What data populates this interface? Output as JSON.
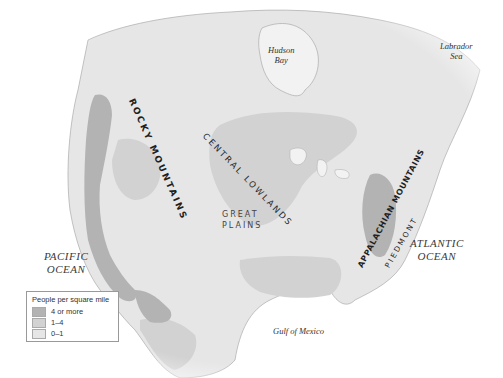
{
  "map": {
    "subject": "North America population density",
    "water_labels": {
      "hudson_bay": [
        "Hudson",
        "Bay"
      ],
      "labrador_sea": [
        "Labrador",
        "Sea"
      ],
      "pacific_ocean": [
        "PACIFIC",
        "OCEAN"
      ],
      "atlantic_ocean": [
        "ATLANTIC",
        "OCEAN"
      ],
      "gulf_of_mexico": "Gulf of Mexico"
    },
    "region_labels": {
      "rocky_mountains": "ROCKY MOUNTAINS",
      "central_lowlands": "CENTRAL LOWLANDS",
      "great_plains": [
        "GREAT",
        "PLAINS"
      ],
      "appalachian_mountains": "APPALACHIAN MOUNTAINS",
      "piedmont": "PIEDMONT"
    },
    "colors": {
      "high": "#b3b3b3",
      "medium": "#d2d2d2",
      "low": "#e6e6e6",
      "water": "#ffffff",
      "outline": "#9a9a9a"
    }
  },
  "legend": {
    "title": "People per square mile",
    "items": [
      {
        "label": "4 or more",
        "color": "#b3b3b3"
      },
      {
        "label": "1–4",
        "color": "#d2d2d2"
      },
      {
        "label": "0–1",
        "color": "#e6e6e6"
      }
    ]
  }
}
